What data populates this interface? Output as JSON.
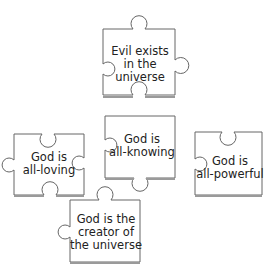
{
  "diagram": {
    "type": "puzzle-pieces",
    "pieces": [
      {
        "id": "evil",
        "lines": [
          "Evil exists",
          "in the",
          "universe"
        ]
      },
      {
        "id": "loving",
        "lines": [
          "God is",
          "all-loving"
        ]
      },
      {
        "id": "knowing",
        "lines": [
          "God is",
          "all-knowing"
        ]
      },
      {
        "id": "powerful",
        "lines": [
          "God is",
          "all-powerful"
        ]
      },
      {
        "id": "creator",
        "lines": [
          "God is the",
          "creator of",
          "the universe"
        ]
      }
    ]
  },
  "colors": {
    "stroke": "#666666",
    "shadow": "#9a9a9a",
    "fill": "#ffffff",
    "text": "#222222"
  }
}
